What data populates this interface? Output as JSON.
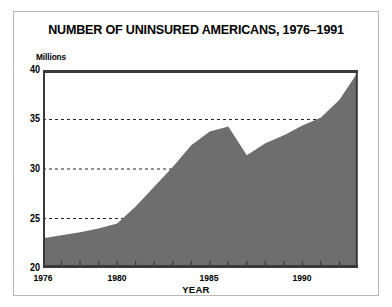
{
  "chart_data": {
    "type": "area",
    "title": "NUMBER OF UNINSURED AMERICANS, 1976–1991",
    "xlabel": "YEAR",
    "ylabel": "Millions",
    "ylim": [
      20,
      40
    ],
    "xlim": [
      1976,
      1993
    ],
    "yticks": [
      20,
      25,
      30,
      35,
      40
    ],
    "gridlines": [
      25,
      30,
      35
    ],
    "grid": "horizontal-dashed",
    "legend": "none",
    "fill_color": "#6e6e6e",
    "xtick_labels": [
      "1976",
      "1980",
      "1985",
      "1990"
    ],
    "xtick_values": [
      1976,
      1980,
      1985,
      1990
    ],
    "x": [
      1976,
      1977,
      1978,
      1979,
      1980,
      1981,
      1982,
      1983,
      1984,
      1985,
      1986,
      1987,
      1988,
      1989,
      1990,
      1991,
      1992,
      1993
    ],
    "values": [
      23.0,
      23.3,
      23.6,
      24.0,
      24.5,
      26.2,
      28.2,
      30.2,
      32.4,
      33.8,
      34.3,
      31.4,
      32.6,
      33.4,
      34.4,
      35.2,
      37.0,
      39.8
    ]
  },
  "axis": {
    "y_tick_labels": [
      "40",
      "35",
      "30",
      "25",
      "20"
    ],
    "unit_label": "Millions"
  }
}
